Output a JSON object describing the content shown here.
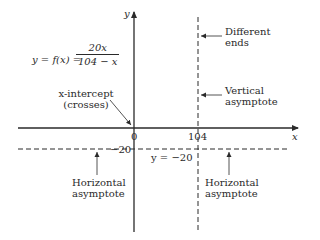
{
  "equation": {
    "lhs": "y = f(x) =",
    "numerator": "20x",
    "denominator": "104 − x"
  },
  "axes": {
    "x_label": "x",
    "y_label": "y",
    "origin_label": "0",
    "x_tick_label": "104",
    "y_tick_label": "−20"
  },
  "annotations": {
    "x_intercept": [
      "x-intercept",
      "(crosses)"
    ],
    "different_ends": [
      "Different",
      "ends"
    ],
    "vertical_asymptote": [
      "Vertical",
      "asymptote"
    ],
    "horizontal_asymptote_left": [
      "Horizontal",
      "asymptote"
    ],
    "horizontal_asymptote_right": [
      "Horizontal",
      "asymptote"
    ],
    "h_asymptote_eq": "y = −20"
  },
  "colors": {
    "ink": "#2a2a2a",
    "background": "#ffffff"
  }
}
